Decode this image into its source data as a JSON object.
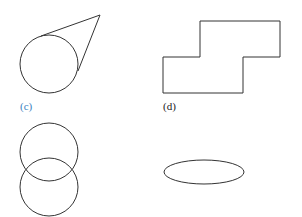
{
  "figures": [
    {
      "id": "c",
      "label": "(c)",
      "label_color": "#3a7fc1",
      "description": "circle with two tangent lines meeting at an external point",
      "circle": {
        "cx": 49,
        "cy": 64,
        "r": 29
      },
      "apex": {
        "x": 100,
        "y": 15
      },
      "tangent_points": [
        {
          "x": 41,
          "y": 36
        },
        {
          "x": 78,
          "y": 71
        }
      ]
    },
    {
      "id": "d",
      "label": "(d)",
      "label_color": "#222222",
      "description": "stepped rectilinear polygon",
      "points": "200,21 280,21 280,57 243,57 243,93 163,93 163,57 200,57"
    },
    {
      "id": "e",
      "label": "",
      "description": "two overlapping circles stacked vertically",
      "circles": [
        {
          "cx": 49,
          "cy": 152,
          "r": 29
        },
        {
          "cx": 49,
          "cy": 187,
          "r": 29
        }
      ]
    },
    {
      "id": "f",
      "label": "",
      "description": "horizontal ellipse",
      "ellipse": {
        "cx": 204,
        "cy": 172,
        "rx": 40,
        "ry": 12
      }
    }
  ],
  "stroke_color": "#333333"
}
